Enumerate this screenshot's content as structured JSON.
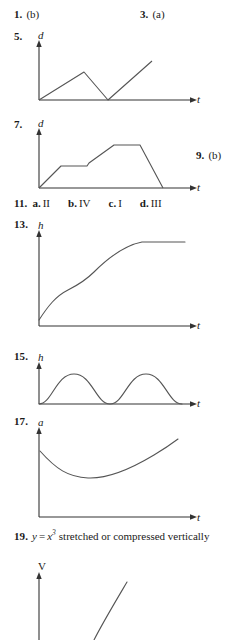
{
  "page": {
    "kind": "textbook-answer-key",
    "ink_color": "#1a1a1a",
    "curve_color": "#555555",
    "axis_color": "#333333",
    "background": "#ffffff"
  },
  "answers": {
    "a1": {
      "number": "1.",
      "value": "(b)"
    },
    "a3": {
      "number": "3.",
      "value": "(a)"
    },
    "a5": {
      "number": "5.",
      "value": ""
    },
    "a7": {
      "number": "7.",
      "value": ""
    },
    "a9": {
      "number": "9.",
      "value": "(b)"
    },
    "a11": {
      "number": "11.",
      "parts": [
        {
          "label": "a.",
          "value": "II"
        },
        {
          "label": "b.",
          "value": "IV"
        },
        {
          "label": "c.",
          "value": "I"
        },
        {
          "label": "d.",
          "value": "III"
        }
      ]
    },
    "a13": {
      "number": "13.",
      "value": ""
    },
    "a15": {
      "number": "15.",
      "value": ""
    },
    "a17": {
      "number": "17.",
      "value": ""
    },
    "a19": {
      "number": "19.",
      "lhs": "y",
      "equals": "=",
      "base": "x",
      "exponent": "3",
      "text": "stretched or compressed vertically"
    }
  },
  "figures": {
    "f5": {
      "ylabel": "d",
      "xlabel": "t",
      "shape": "rise-fall-rise piecewise-linear"
    },
    "f7": {
      "ylabel": "d",
      "xlabel": "t",
      "shape": "rise-plateau-rise-plateau-fall piecewise-linear"
    },
    "f13": {
      "ylabel": "h",
      "xlabel": "t",
      "shape": "increasing S-curve leveling off"
    },
    "f15": {
      "ylabel": "h",
      "xlabel": "t",
      "shape": "two sinusoidal humps"
    },
    "f17": {
      "ylabel": "a",
      "xlabel": "t",
      "shape": "U-shaped decreasing then increasing"
    },
    "f21": {
      "ylabel": "V",
      "xlabel": "",
      "shape": "increasing curve, cropped at page bottom"
    }
  }
}
